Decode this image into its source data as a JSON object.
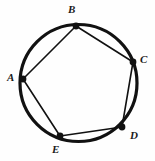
{
  "figure": {
    "background_color": "#fefefe",
    "stroke_color": "#111111",
    "circle": {
      "center_x": 78.5,
      "center_y": 83,
      "radius": 58.5,
      "stroke_width": 3.2
    },
    "chord_stroke_width": 1.6,
    "vertex_dot_radius": 3.4,
    "vertices": [
      {
        "id": "A",
        "label": "A",
        "x": 23,
        "y": 79,
        "label_x": 7,
        "label_y": 72
      },
      {
        "id": "B",
        "label": "B",
        "x": 76,
        "y": 26,
        "label_x": 68,
        "label_y": 4
      },
      {
        "id": "C",
        "label": "C",
        "x": 133,
        "y": 62,
        "label_x": 140,
        "label_y": 54
      },
      {
        "id": "D",
        "label": "D",
        "x": 122,
        "y": 127,
        "label_x": 130,
        "label_y": 130
      },
      {
        "id": "E",
        "label": "E",
        "x": 60,
        "y": 136,
        "label_x": 52,
        "label_y": 144
      }
    ],
    "chords": [
      {
        "from": "A",
        "to": "B"
      },
      {
        "from": "B",
        "to": "C"
      },
      {
        "from": "C",
        "to": "D"
      },
      {
        "from": "D",
        "to": "E"
      },
      {
        "from": "E",
        "to": "A"
      }
    ]
  }
}
